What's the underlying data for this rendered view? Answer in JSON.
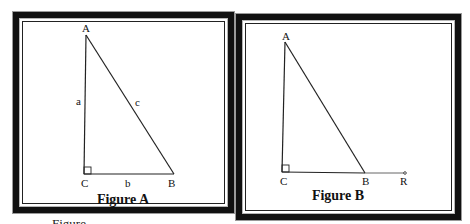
{
  "figures": [
    {
      "id": "A",
      "caption": "Figure A",
      "vertices": {
        "A": "A",
        "B": "B",
        "C": "C"
      },
      "sides": {
        "a": "a",
        "b": "b",
        "c": "c"
      },
      "right_angle_at": "C"
    },
    {
      "id": "B",
      "caption": "Figure B",
      "vertices": {
        "A": "A",
        "B": "B",
        "C": "C",
        "R": "R"
      },
      "right_angle_at": "C",
      "extension": "ray CB extended beyond B to R"
    }
  ],
  "footer_text": "Figure ..."
}
